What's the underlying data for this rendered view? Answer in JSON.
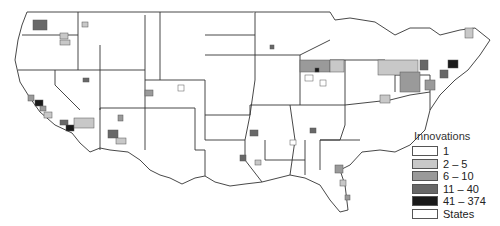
{
  "map": {
    "title": "",
    "region": "Contiguous United States (counties)",
    "legend": {
      "title": "Innovations",
      "items": [
        {
          "label": "1",
          "color": "#ffffff"
        },
        {
          "label": "2 – 5",
          "color": "#c8c8c8"
        },
        {
          "label": "6 – 10",
          "color": "#9a9a9a"
        },
        {
          "label": "11 – 40",
          "color": "#686868"
        },
        {
          "label": "41 – 374",
          "color": "#1a1a1a"
        },
        {
          "label": "States",
          "color": "#ffffff"
        }
      ]
    },
    "colors": {
      "state_border": "#333333",
      "county_border": "#555555",
      "background": "#ffffff"
    }
  }
}
